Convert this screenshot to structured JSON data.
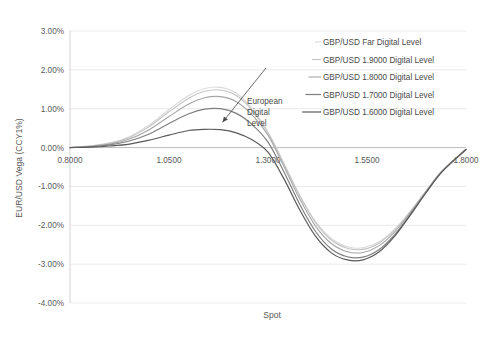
{
  "chart_data": {
    "type": "line",
    "title": "",
    "xlabel": "Spot",
    "ylabel": "EUR/USD Vega (CCY1%)",
    "xlim": [
      0.8,
      1.8
    ],
    "ylim": [
      -0.04,
      0.03
    ],
    "xticks": [
      "0.8000",
      "1.0500",
      "1.3000",
      "1.5500",
      "1.8000"
    ],
    "xtick_values": [
      0.8,
      1.05,
      1.3,
      1.55,
      1.8
    ],
    "yticks": [
      "3.00%",
      "2.00%",
      "1.00%",
      "0.00%",
      "-1.00%",
      "-2.00%",
      "-3.00%",
      "-4.00%"
    ],
    "ytick_values": [
      0.03,
      0.02,
      0.01,
      0.0,
      -0.01,
      -0.02,
      -0.03,
      -0.04
    ],
    "grid": true,
    "legend_position": "top-right",
    "x": [
      0.8,
      0.85,
      0.9,
      0.95,
      1.0,
      1.05,
      1.1,
      1.14,
      1.18,
      1.22,
      1.26,
      1.3,
      1.34,
      1.38,
      1.42,
      1.46,
      1.5,
      1.54,
      1.58,
      1.62,
      1.66,
      1.7,
      1.74,
      1.8
    ],
    "series": [
      {
        "name": "GBP/USD Far Digital Level",
        "color": "#d9d9d9",
        "width": 1.1,
        "values": [
          0.0,
          0.0004,
          0.0012,
          0.0028,
          0.0058,
          0.0098,
          0.0134,
          0.0152,
          0.0155,
          0.014,
          0.01,
          0.004,
          -0.004,
          -0.0122,
          -0.019,
          -0.0234,
          -0.0255,
          -0.0258,
          -0.0243,
          -0.021,
          -0.0163,
          -0.011,
          -0.006,
          -0.0005
        ]
      },
      {
        "name": "GBP/USD 1.9000 Digital Level",
        "color": "#c4c4c4",
        "width": 1.1,
        "values": [
          0.0,
          0.0004,
          0.0011,
          0.0026,
          0.0054,
          0.0092,
          0.0127,
          0.0145,
          0.0148,
          0.0134,
          0.0096,
          0.0038,
          -0.0042,
          -0.0124,
          -0.0193,
          -0.0238,
          -0.0259,
          -0.0262,
          -0.0246,
          -0.0212,
          -0.0164,
          -0.0111,
          -0.006,
          -0.0005
        ]
      },
      {
        "name": "GBP/USD 1.8000 Digital Level",
        "color": "#a6a6a6",
        "width": 1.1,
        "values": [
          0.0,
          0.0003,
          0.0009,
          0.0022,
          0.0046,
          0.008,
          0.0112,
          0.0128,
          0.0131,
          0.0118,
          0.0084,
          0.0032,
          -0.0048,
          -0.0132,
          -0.0202,
          -0.0247,
          -0.0268,
          -0.027,
          -0.0253,
          -0.0217,
          -0.0167,
          -0.0112,
          -0.006,
          -0.0005
        ]
      },
      {
        "name": "GBP/USD 1.7000 Digital Level",
        "color": "#7f7f7f",
        "width": 1.2,
        "values": [
          0.0,
          0.0002,
          0.0007,
          0.0017,
          0.0035,
          0.0062,
          0.0087,
          0.0099,
          0.01,
          0.0088,
          0.0059,
          0.0014,
          -0.0062,
          -0.0146,
          -0.0216,
          -0.0261,
          -0.0281,
          -0.0282,
          -0.0263,
          -0.0224,
          -0.0171,
          -0.0114,
          -0.0061,
          -0.0005
        ]
      },
      {
        "name": "GBP/USD 1.6000 Digital Level",
        "color": "#5a5a5a",
        "width": 1.2,
        "values": [
          0.0,
          0.0001,
          0.0004,
          0.0009,
          0.0019,
          0.0032,
          0.0044,
          0.0047,
          0.0046,
          0.0038,
          0.002,
          -0.0012,
          -0.008,
          -0.016,
          -0.0228,
          -0.0271,
          -0.0289,
          -0.0289,
          -0.0269,
          -0.0228,
          -0.0173,
          -0.0115,
          -0.0062,
          -0.0005
        ]
      }
    ],
    "annotations": [
      {
        "text_lines": [
          "European",
          "Digital",
          "Level"
        ],
        "arrow_from": [
          1.295,
          0.0205
        ],
        "arrow_to": [
          1.185,
          0.0065
        ]
      }
    ]
  },
  "axis": {
    "ylabel": "EUR/USD Vega (CCY1%)",
    "xlabel": "Spot"
  },
  "legend": {
    "items": [
      "GBP/USD Far Digital Level",
      "GBP/USD 1.9000 Digital Level",
      "GBP/USD 1.8000 Digital Level",
      "GBP/USD 1.7000 Digital Level",
      "GBP/USD 1.6000 Digital Level"
    ]
  },
  "annotation": {
    "line1": "European",
    "line2": "Digital",
    "line3": "Level"
  }
}
